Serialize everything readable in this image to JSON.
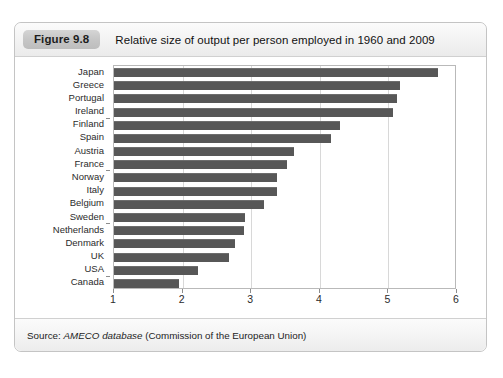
{
  "figure": {
    "badge": "Figure 9.8",
    "title": "Relative size of output per person employed in 1960 and 2009",
    "source_prefix": "Source: ",
    "source_italic": "AMECO database",
    "source_suffix": " (Commission of the European Union)"
  },
  "chart_data": {
    "type": "bar",
    "orientation": "horizontal",
    "title": "Relative size of output per person employed in 1960 and 2009",
    "xlabel": "",
    "ylabel": "",
    "xlim": [
      1,
      6
    ],
    "xticks": [
      1,
      2,
      3,
      4,
      5,
      6
    ],
    "grid": true,
    "legend": "none",
    "bar_color": "#575757",
    "categories": [
      "Japan",
      "Greece",
      "Portugal",
      "Ireland",
      "Finland",
      "Spain",
      "Austria",
      "France",
      "Norway",
      "Italy",
      "Belgium",
      "Sweden",
      "Netherlands",
      "Denmark",
      "UK",
      "USA",
      "Canada"
    ],
    "values": [
      5.72,
      5.17,
      5.13,
      5.07,
      4.3,
      4.17,
      3.62,
      3.52,
      3.38,
      3.38,
      3.19,
      2.91,
      2.89,
      2.76,
      2.68,
      2.23,
      1.95
    ]
  }
}
